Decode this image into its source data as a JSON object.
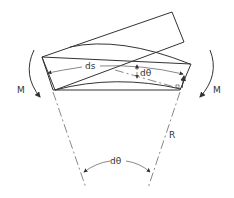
{
  "diagram": {
    "type": "beam-bending-element",
    "labels": {
      "arc_length": "ds",
      "small_angle_top": "dθ",
      "moment_left": "M",
      "moment_right": "M",
      "radius": "R",
      "center_angle": "dθ"
    },
    "line_color": "#333333",
    "background": "#ffffff"
  }
}
